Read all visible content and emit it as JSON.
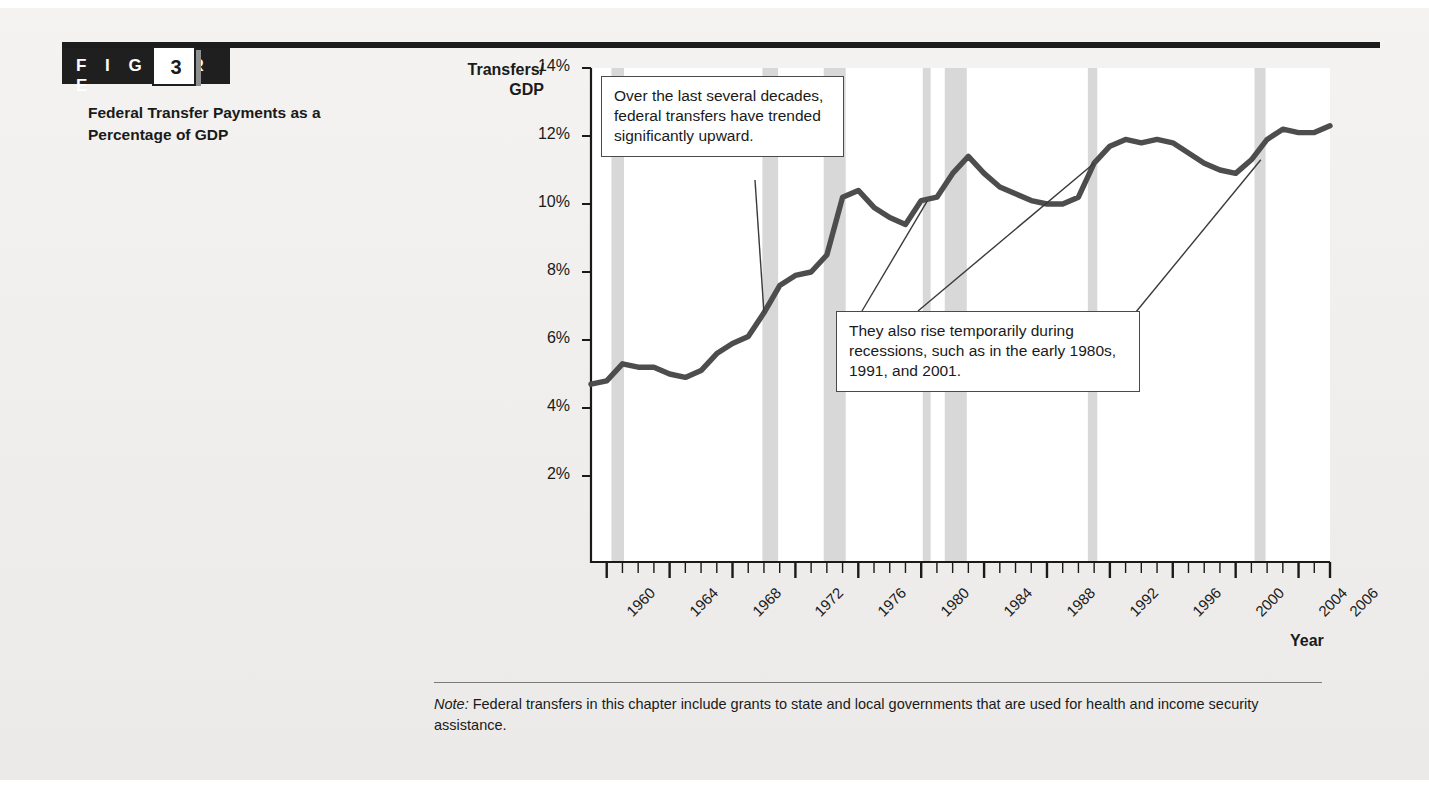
{
  "figure": {
    "banner_label": "F I G U R E",
    "number": "3",
    "title": "Federal Transfer Payments as a Percentage of GDP"
  },
  "note": {
    "label": "Note:",
    "text": " Federal transfers in this chapter include grants to state and local governments that are used for health and income security assistance."
  },
  "callouts": [
    {
      "id": "callout-1",
      "text": "Over the last several decades, federal transfers have trended significantly upward."
    },
    {
      "id": "callout-2",
      "text": "They also rise temporarily during recessions, such as in the early 1980s, 1991, and 2001."
    }
  ],
  "colors": {
    "line": "#4d4d4d",
    "recession_band": "#d8d8d8",
    "axis": "#1a1a1a",
    "banner": "#1f1f1f",
    "page": "#f1f0ee"
  },
  "chart_data": {
    "type": "line",
    "title": "Federal Transfer Payments as a Percentage of GDP",
    "xlabel": "Year",
    "ylabel": "Transfers/ GDP",
    "xlim": [
      1959,
      2006
    ],
    "ylim": [
      0,
      14
    ],
    "grid": false,
    "legend": "none",
    "ytick_labels": [
      "14%",
      "12%",
      "10%",
      "8%",
      "6%",
      "4%",
      "2%"
    ],
    "ytick_values": [
      14,
      12,
      10,
      8,
      6,
      4,
      2
    ],
    "xtick_labels": [
      "1960",
      "1964",
      "1968",
      "1972",
      "1976",
      "1980",
      "1984",
      "1988",
      "1992",
      "1996",
      "2000",
      "2004",
      "2006"
    ],
    "xtick_values": [
      1960,
      1964,
      1968,
      1972,
      1976,
      1980,
      1984,
      1988,
      1992,
      1996,
      2000,
      2004,
      2006
    ],
    "xminor_step": 1,
    "series": [
      {
        "name": "Federal transfers / GDP",
        "x": [
          1959,
          1960,
          1961,
          1962,
          1963,
          1964,
          1965,
          1966,
          1967,
          1968,
          1969,
          1970,
          1971,
          1972,
          1973,
          1974,
          1975,
          1976,
          1977,
          1978,
          1979,
          1980,
          1981,
          1982,
          1983,
          1984,
          1985,
          1986,
          1987,
          1988,
          1989,
          1990,
          1991,
          1992,
          1993,
          1994,
          1995,
          1996,
          1997,
          1998,
          1999,
          2000,
          2001,
          2002,
          2003,
          2004,
          2005,
          2006
        ],
        "values": [
          4.7,
          4.8,
          5.3,
          5.2,
          5.2,
          5.0,
          4.9,
          5.1,
          5.6,
          5.9,
          6.1,
          6.8,
          7.6,
          7.9,
          8.0,
          8.5,
          10.2,
          10.4,
          9.9,
          9.6,
          9.4,
          10.1,
          10.2,
          10.9,
          11.4,
          10.9,
          10.5,
          10.3,
          10.1,
          10.0,
          10.0,
          10.2,
          11.2,
          11.7,
          11.9,
          11.8,
          11.9,
          11.8,
          11.5,
          11.2,
          11.0,
          10.9,
          11.3,
          11.9,
          12.2,
          12.1,
          12.1,
          12.3
        ]
      }
    ],
    "recession_bands": [
      {
        "start": 1960.3,
        "end": 1961.1,
        "label": "1960-61"
      },
      {
        "start": 1969.9,
        "end": 1970.9,
        "label": "1969-70"
      },
      {
        "start": 1973.8,
        "end": 1975.2,
        "label": "1973-75"
      },
      {
        "start": 1980.1,
        "end": 1980.6,
        "label": "1980"
      },
      {
        "start": 1981.5,
        "end": 1982.9,
        "label": "1981-82"
      },
      {
        "start": 1990.6,
        "end": 1991.2,
        "label": "1990-91"
      },
      {
        "start": 2001.2,
        "end": 2001.9,
        "label": "2001"
      }
    ],
    "annotations": [
      {
        "text": "Over the last several decades, federal transfers have trended significantly upward.",
        "points_to_x": 1970.0,
        "points_to_y": 6.8
      },
      {
        "text": "They also rise temporarily during recessions, such as in the early 1980s, 1991, and 2001.",
        "points_to_x": [
          1980.4,
          1991.0,
          2001.6
        ],
        "points_to_y": [
          10.1,
          11.2,
          11.3
        ]
      }
    ]
  }
}
